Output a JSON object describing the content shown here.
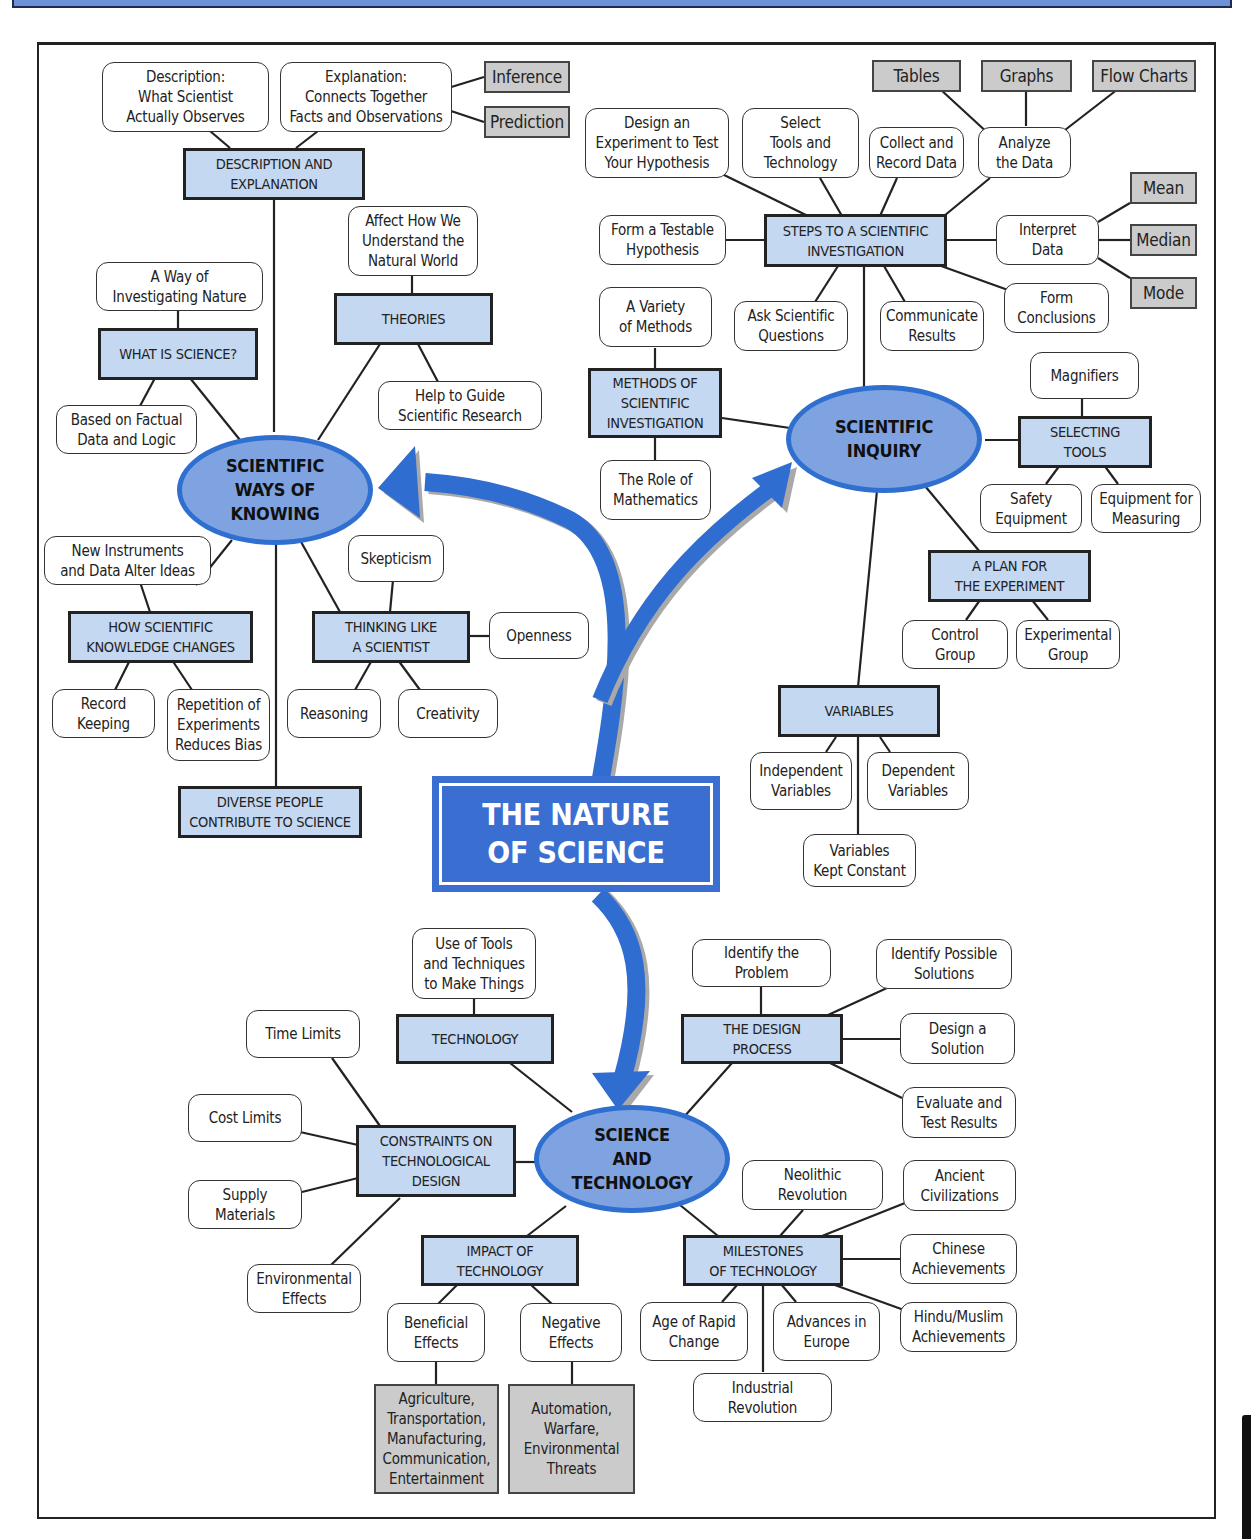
{
  "title": "THE NATURE OF SCIENCE",
  "title_display": "THE NATURE\nOF SCIENCE",
  "colors": {
    "arrow_blue": "#2f6dd0",
    "oval_fill": "#7fa3e0",
    "category_fill": "#c4d8f2",
    "example_gray": "#cbcbcb",
    "line": "#222222"
  },
  "hubs": {
    "ways_of_knowing": "SCIENTIFIC\nWAYS OF\nKNOWING",
    "inquiry": "SCIENTIFIC\nINQUIRY",
    "sci_tech": "SCIENCE\nAND\nTECHNOLOGY"
  },
  "ways_of_knowing": {
    "desc_expl": {
      "label": "DESCRIPTION AND\nEXPLANATION",
      "description": "Description:\nWhat Scientist\nActually Observes",
      "explanation": "Explanation:\nConnects Together\nFacts and Observations",
      "inference": "Inference",
      "prediction": "Prediction"
    },
    "what_is_science": {
      "label": "WHAT IS SCIENCE?",
      "way": "A Way of\nInvestigating Nature",
      "based": "Based on Factual\nData and Logic"
    },
    "theories": {
      "label": "THEORIES",
      "affect": "Affect How We\nUnderstand the\nNatural World",
      "guide": "Help to Guide\nScientific Research"
    },
    "knowledge_changes": {
      "label": "HOW SCIENTIFIC\nKNOWLEDGE CHANGES",
      "instruments": "New Instruments\nand Data Alter Ideas",
      "record": "Record\nKeeping",
      "repetition": "Repetition of\nExperiments\nReduces Bias"
    },
    "thinking": {
      "label": "THINKING LIKE\nA SCIENTIST",
      "skepticism": "Skepticism",
      "openness": "Openness",
      "reasoning": "Reasoning",
      "creativity": "Creativity"
    },
    "diverse": "DIVERSE PEOPLE\nCONTRIBUTE TO SCIENCE"
  },
  "inquiry": {
    "steps": {
      "label": "STEPS TO A SCIENTIFIC\nINVESTIGATION",
      "design": "Design an\nExperiment to Test\nYour Hypothesis",
      "select": "Select\nTools and\nTechnology",
      "collect": "Collect and\nRecord Data",
      "analyze": "Analyze\nthe Data",
      "tables": "Tables",
      "graphs": "Graphs",
      "flow": "Flow Charts",
      "hypothesis": "Form a Testable\nHypothesis",
      "interpret": "Interpret\nData",
      "mean": "Mean",
      "median": "Median",
      "mode": "Mode",
      "ask": "Ask Scientific\nQuestions",
      "communicate": "Communicate\nResults",
      "conclusions": "Form\nConclusions"
    },
    "methods": {
      "label": "METHODS OF\nSCIENTIFIC\nINVESTIGATION",
      "variety": "A Variety\nof Methods",
      "math": "The Role of\nMathematics"
    },
    "tools": {
      "label": "SELECTING\nTOOLS",
      "magnifiers": "Magnifiers",
      "safety": "Safety\nEquipment",
      "measuring": "Equipment for\nMeasuring"
    },
    "plan": {
      "label": "A PLAN FOR\nTHE EXPERIMENT",
      "control": "Control\nGroup",
      "experimental": "Experimental\nGroup"
    },
    "variables": {
      "label": "VARIABLES",
      "independent": "Independent\nVariables",
      "dependent": "Dependent\nVariables",
      "constant": "Variables\nKept Constant"
    }
  },
  "sci_tech": {
    "technology": {
      "label": "TECHNOLOGY",
      "use": "Use of Tools\nand Techniques\nto Make Things"
    },
    "design": {
      "label": "THE DESIGN\nPROCESS",
      "identify_problem": "Identify the\nProblem",
      "identify_solutions": "Identify Possible\nSolutions",
      "design_solution": "Design a\nSolution",
      "evaluate": "Evaluate and\nTest Results"
    },
    "constraints": {
      "label": "CONSTRAINTS ON\nTECHNOLOGICAL\nDESIGN",
      "time": "Time Limits",
      "cost": "Cost Limits",
      "supply": "Supply\nMaterials",
      "environmental": "Environmental\nEffects"
    },
    "impact": {
      "label": "IMPACT OF\nTECHNOLOGY",
      "beneficial": "Beneficial\nEffects",
      "negative": "Negative\nEffects",
      "beneficial_examples": "Agriculture,\nTransportation,\nManufacturing,\nCommunication,\nEntertainment",
      "negative_examples": "Automation,\nWarfare,\nEnvironmental\nThreats"
    },
    "milestones": {
      "label": "MILESTONES\nOF TECHNOLOGY",
      "neolithic": "Neolithic\nRevolution",
      "ancient": "Ancient\nCivilizations",
      "chinese": "Chinese\nAchievements",
      "hindu": "Hindu/Muslim\nAchievements",
      "rapid": "Age of Rapid\nChange",
      "europe": "Advances in\nEurope",
      "industrial": "Industrial\nRevolution"
    }
  }
}
